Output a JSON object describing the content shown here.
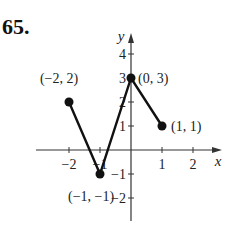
{
  "problem_number": "65.",
  "chart_data": {
    "type": "line",
    "title": "",
    "xlabel": "x",
    "ylabel": "y",
    "xlim": [
      -2.7,
      2.9
    ],
    "ylim": [
      -3,
      4.5
    ],
    "x_ticks": [
      -2,
      -1,
      1,
      2
    ],
    "x_tick_labels": [
      "−2",
      "−1",
      "1",
      "2"
    ],
    "y_ticks": [
      -2,
      -1,
      1,
      2,
      3,
      4
    ],
    "y_tick_labels": [
      "−2",
      "−1",
      "1",
      "2",
      "3",
      "4"
    ],
    "grid": false,
    "series": [
      {
        "name": "f",
        "x": [
          -2,
          -1,
          0,
          1
        ],
        "y": [
          2,
          -1,
          3,
          1
        ]
      }
    ],
    "annotations": [
      {
        "text": "(−2, 2)",
        "x": -2,
        "y": 2
      },
      {
        "text": "(−1, −1)",
        "x": -1,
        "y": -1
      },
      {
        "text": "(0, 3)",
        "x": 0,
        "y": 3
      },
      {
        "text": "(1, 1)",
        "x": 1,
        "y": 1
      }
    ]
  }
}
